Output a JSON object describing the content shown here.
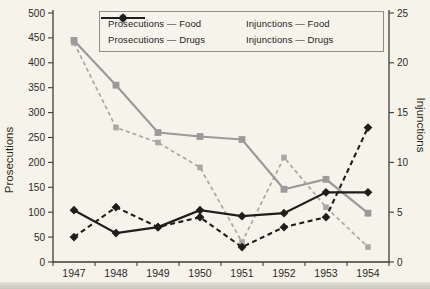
{
  "figure": {
    "background_color": "#f6f3ea",
    "axis_color": "#3f3e39",
    "text_color": "#2b2b26"
  },
  "chart_data": {
    "type": "line",
    "x": [
      "1947",
      "1948",
      "1949",
      "1950",
      "1951",
      "1952",
      "1953",
      "1954"
    ],
    "left_axis": {
      "label": "Prosecutions",
      "range": [
        0,
        500
      ],
      "ticks": [
        0,
        50,
        100,
        150,
        200,
        250,
        300,
        350,
        400,
        450,
        500
      ]
    },
    "right_axis": {
      "label": "Injunctions",
      "range": [
        0,
        25
      ],
      "ticks": [
        0,
        5,
        10,
        15,
        20,
        25
      ]
    },
    "grid": false,
    "legend_position": "top-center",
    "series": [
      {
        "name": "Prosecutions — Food",
        "axis": "left",
        "line_style": "solid",
        "marker": "square",
        "color": "#9a9a98",
        "values": [
          445,
          355,
          260,
          252,
          246,
          146,
          166,
          98
        ]
      },
      {
        "name": "Prosecutions — Drugs",
        "axis": "left",
        "line_style": "solid",
        "marker": "diamond",
        "color": "#1e1e1c",
        "values": [
          104,
          58,
          70,
          104,
          92,
          98,
          140,
          140
        ]
      },
      {
        "name": "Injunctions — Food",
        "axis": "right",
        "line_style": "dashed",
        "marker": "square",
        "color": "#a8a8a5",
        "values": [
          22,
          13.5,
          12,
          9.5,
          2,
          10.5,
          5.5,
          1.5
        ]
      },
      {
        "name": "Injunctions — Drugs",
        "axis": "right",
        "line_style": "dashed",
        "marker": "diamond",
        "color": "#1e1e1c",
        "values": [
          2.5,
          5.5,
          3.5,
          4.5,
          1.5,
          3.5,
          4.5,
          13.5
        ]
      }
    ]
  }
}
